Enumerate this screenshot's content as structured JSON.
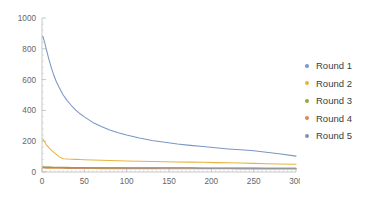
{
  "chart_data": {
    "type": "line",
    "title": "",
    "xlabel": "",
    "ylabel": "",
    "xlim": [
      0,
      300
    ],
    "ylim": [
      0,
      1000
    ],
    "grid": false,
    "legend_position": "right",
    "xticks": [
      0,
      50,
      100,
      150,
      200,
      250,
      300
    ],
    "xtick_labels": [
      "0",
      "50",
      "100",
      "150",
      "200",
      "250",
      "300"
    ],
    "yticks": [
      0,
      200,
      400,
      600,
      800,
      1000
    ],
    "ytick_labels": [
      "0",
      "200",
      "400",
      "600",
      "800",
      "1000"
    ],
    "x": [
      1,
      3,
      5,
      8,
      11,
      14,
      17,
      20,
      25,
      30,
      35,
      40,
      45,
      50,
      60,
      70,
      80,
      90,
      100,
      115,
      130,
      145,
      160,
      175,
      190,
      205,
      220,
      235,
      250,
      265,
      280,
      300
    ],
    "series": [
      {
        "name": "Round 1",
        "color": "#7b96c4",
        "values": [
          880,
          845,
          800,
          735,
          678,
          628,
          586,
          552,
          500,
          462,
          430,
          402,
          378,
          358,
          322,
          295,
          273,
          255,
          240,
          221,
          205,
          193,
          182,
          173,
          165,
          157,
          150,
          144,
          138,
          128,
          118,
          103
        ]
      },
      {
        "name": "Round 2",
        "color": "#e8b33c",
        "values": [
          215,
          196,
          178,
          158,
          142,
          128,
          114,
          100,
          86,
          84,
          83,
          82,
          81,
          80,
          78,
          76,
          75,
          73,
          72,
          70,
          68,
          66,
          65,
          64,
          63,
          61,
          60,
          58,
          56,
          54,
          52,
          50
        ]
      },
      {
        "name": "Round 3",
        "color": "#9aa43a",
        "values": [
          34,
          33,
          33,
          32,
          32,
          31,
          31,
          30,
          30,
          30,
          29,
          29,
          29,
          29,
          28,
          28,
          28,
          28,
          28,
          27,
          27,
          27,
          27,
          27,
          26,
          26,
          26,
          26,
          26,
          25,
          25,
          25
        ]
      },
      {
        "name": "Round 4",
        "color": "#dd8b4a",
        "values": [
          26,
          26,
          25,
          25,
          25,
          24,
          24,
          24,
          24,
          23,
          23,
          23,
          23,
          23,
          23,
          22,
          22,
          22,
          22,
          22,
          22,
          21,
          21,
          21,
          21,
          21,
          21,
          20,
          20,
          20,
          20,
          20
        ]
      },
      {
        "name": "Round 5",
        "color": "#8a8fb0",
        "values": [
          31,
          30,
          30,
          30,
          29,
          29,
          29,
          29,
          28,
          28,
          28,
          28,
          28,
          27,
          27,
          27,
          27,
          27,
          26,
          26,
          26,
          26,
          26,
          26,
          25,
          25,
          25,
          25,
          25,
          24,
          24,
          24
        ]
      }
    ]
  },
  "legend": {
    "items": [
      {
        "label": "Round 1",
        "color": "#7b96c4"
      },
      {
        "label": "Round 2",
        "color": "#e8b33c"
      },
      {
        "label": "Round 3",
        "color": "#9aa43a"
      },
      {
        "label": "Round 4",
        "color": "#dd8b4a"
      },
      {
        "label": "Round 5",
        "color": "#8a8fb0"
      }
    ]
  }
}
